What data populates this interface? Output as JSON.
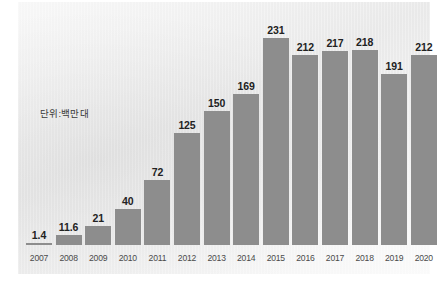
{
  "chart_data": {
    "type": "bar",
    "title": "",
    "subtitle": "",
    "annotation": "단위:백만대",
    "xlabel": "",
    "ylabel": "",
    "categories": [
      "2007",
      "2008",
      "2009",
      "2010",
      "2011",
      "2012",
      "2013",
      "2014",
      "2015",
      "2016",
      "2017",
      "2018",
      "2019",
      "2020"
    ],
    "values": [
      1.4,
      11.6,
      21,
      40,
      72,
      125,
      150,
      169,
      231,
      212,
      217,
      218,
      191,
      212
    ],
    "value_labels": [
      "1.4",
      "11.6",
      "21",
      "40",
      "72",
      "125",
      "150",
      "169",
      "231",
      "212",
      "217",
      "218",
      "191",
      "212"
    ],
    "ylim": [
      0,
      231
    ],
    "grid": false,
    "legend": null,
    "series": [
      {
        "name": "",
        "values": [
          1.4,
          11.6,
          21,
          40,
          72,
          125,
          150,
          169,
          231,
          212,
          217,
          218,
          191,
          212
        ]
      }
    ],
    "colors": {
      "bar": "#8d8d8d",
      "value_label": "#222222",
      "tick_label": "#4a4a4a",
      "annotation": "#3a3a3a",
      "panel_light": "#fafafa",
      "panel_dark": "#e9e9e9",
      "page_background": "#ffffff"
    }
  },
  "bars": [
    {
      "year": "2007",
      "value_label": "1.4"
    },
    {
      "year": "2008",
      "value_label": "11.6"
    },
    {
      "year": "2009",
      "value_label": "21"
    },
    {
      "year": "2010",
      "value_label": "40"
    },
    {
      "year": "2011",
      "value_label": "72"
    },
    {
      "year": "2012",
      "value_label": "125"
    },
    {
      "year": "2013",
      "value_label": "150"
    },
    {
      "year": "2014",
      "value_label": "169"
    },
    {
      "year": "2015",
      "value_label": "231"
    },
    {
      "year": "2016",
      "value_label": "212"
    },
    {
      "year": "2017",
      "value_label": "217"
    },
    {
      "year": "2018",
      "value_label": "218"
    },
    {
      "year": "2019",
      "value_label": "191"
    },
    {
      "year": "2020",
      "value_label": "212"
    }
  ],
  "annotation": {
    "unit_note": "단위:백만대"
  }
}
